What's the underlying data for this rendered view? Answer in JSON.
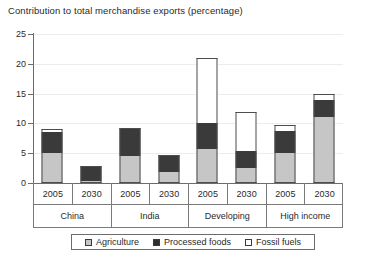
{
  "chart_data": {
    "type": "bar",
    "title": "Contribution to total merchandise exports (percentage)",
    "xlabel": "",
    "ylabel": "",
    "ylim": [
      0,
      25
    ],
    "yticks": [
      0,
      5,
      10,
      15,
      20,
      25
    ],
    "grid": true,
    "stacked": true,
    "legend_position": "bottom",
    "groups": [
      "China",
      "India",
      "Developing",
      "High income"
    ],
    "years": [
      "2005",
      "2030",
      "2005",
      "2030",
      "2005",
      "2030",
      "2005",
      "2030"
    ],
    "categories": [
      "China 2005",
      "China 2030",
      "India 2005",
      "India 2030",
      "Developing 2005",
      "Developing 2030",
      "High income 2005",
      "High income 2030"
    ],
    "series": [
      {
        "name": "Agriculture",
        "color": "#c6c6c6",
        "values": [
          5.0,
          0.4,
          4.5,
          1.8,
          5.7,
          2.5,
          5.0,
          11.0
        ]
      },
      {
        "name": "Processed foods",
        "color": "#3a3a3a",
        "values": [
          3.5,
          2.4,
          4.8,
          2.9,
          4.3,
          2.9,
          3.7,
          3.0
        ]
      },
      {
        "name": "Fossil fuels",
        "color": "#ffffff",
        "values": [
          0.5,
          0.0,
          0.0,
          0.0,
          11.0,
          6.6,
          1.0,
          1.0
        ]
      }
    ],
    "totals": [
      9.0,
      2.8,
      9.3,
      4.7,
      21.0,
      12.0,
      9.7,
      15.0
    ]
  },
  "legend": {
    "items": [
      {
        "label": "Agriculture"
      },
      {
        "label": "Processed foods"
      },
      {
        "label": "Fossil fuels"
      }
    ]
  }
}
